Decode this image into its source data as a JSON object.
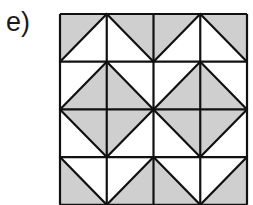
{
  "label": "e)",
  "figure": {
    "rows": 4,
    "cols": 4,
    "shade_color": "#cfcfcf",
    "line_color": "#111111",
    "cells": [
      [
        {
          "diag": "/",
          "shade": "tl"
        },
        {
          "diag": "\\",
          "shade": "tr"
        },
        {
          "diag": "/",
          "shade": "tl"
        },
        {
          "diag": "\\",
          "shade": "tr"
        }
      ],
      [
        {
          "diag": "/",
          "shade": "br"
        },
        {
          "diag": "\\",
          "shade": "bl"
        },
        {
          "diag": "/",
          "shade": "br"
        },
        {
          "diag": "\\",
          "shade": "bl"
        }
      ],
      [
        {
          "diag": "\\",
          "shade": "tr"
        },
        {
          "diag": "/",
          "shade": "tl"
        },
        {
          "diag": "\\",
          "shade": "tr"
        },
        {
          "diag": "/",
          "shade": "tl"
        }
      ],
      [
        {
          "diag": "\\",
          "shade": "bl"
        },
        {
          "diag": "/",
          "shade": "br"
        },
        {
          "diag": "\\",
          "shade": "bl"
        },
        {
          "diag": "/",
          "shade": "br"
        }
      ]
    ]
  }
}
